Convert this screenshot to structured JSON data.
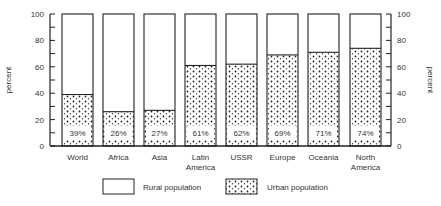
{
  "chart_data": {
    "type": "bar",
    "stacked": true,
    "title": "",
    "xlabel": "",
    "ylabel": "percent",
    "ylim": [
      0,
      100
    ],
    "yticks": [
      0,
      20,
      40,
      60,
      80,
      100
    ],
    "grid": false,
    "dual_y_axis": true,
    "categories": [
      "World",
      "Africa",
      "Asia",
      "Latin America",
      "USSR",
      "Europe",
      "Oceania",
      "North America"
    ],
    "category_lines": [
      [
        "World"
      ],
      [
        "Africa"
      ],
      [
        "Asia"
      ],
      [
        "Latin",
        "America"
      ],
      [
        "USSR"
      ],
      [
        "Europe"
      ],
      [
        "Oceania"
      ],
      [
        "North",
        "America"
      ]
    ],
    "series": [
      {
        "name": "Urban population",
        "pattern": "dotted",
        "values": [
          39,
          26,
          27,
          61,
          62,
          69,
          71,
          74
        ]
      },
      {
        "name": "Rural population",
        "pattern": "blank",
        "values": [
          61,
          74,
          73,
          39,
          38,
          31,
          29,
          26
        ]
      }
    ],
    "data_labels": [
      "39%",
      "26%",
      "27%",
      "61%",
      "62%",
      "69%",
      "71%",
      "74%"
    ],
    "legend": {
      "position": "bottom",
      "entries": [
        "Rural population",
        "Urban population"
      ]
    }
  }
}
